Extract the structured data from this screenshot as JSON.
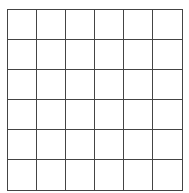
{
  "grid": {
    "rows": 6,
    "columns": 6,
    "line_color": "#444444",
    "cell_color": "#ffffff",
    "cells": [
      [
        "",
        "",
        "",
        "",
        "",
        ""
      ],
      [
        "",
        "",
        "",
        "",
        "",
        ""
      ],
      [
        "",
        "",
        "",
        "",
        "",
        ""
      ],
      [
        "",
        "",
        "",
        "",
        "",
        ""
      ],
      [
        "",
        "",
        "",
        "",
        "",
        ""
      ],
      [
        "",
        "",
        "",
        "",
        "",
        ""
      ]
    ]
  }
}
